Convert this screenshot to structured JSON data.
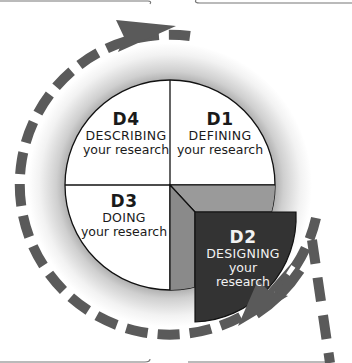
{
  "diagram": {
    "colors": {
      "dash": "#5a5a5a",
      "d2_front": "#333333",
      "d2_top": "#9a9a9a",
      "d2_side": "#8a8a8a",
      "quadrant_fill": "#ffffff",
      "glow": "#b8b8b8"
    },
    "quadrants": [
      {
        "id": "d1",
        "code": "D1",
        "verb": "DEFINING",
        "sub": "your research",
        "position": "top-right"
      },
      {
        "id": "d2",
        "code": "D2",
        "verb": "DESIGNING",
        "sub_line1": "your",
        "sub_line2": "research",
        "position": "bottom-right",
        "highlighted": true
      },
      {
        "id": "d3",
        "code": "D3",
        "verb": "DOING",
        "sub": "your research",
        "position": "bottom-left"
      },
      {
        "id": "d4",
        "code": "D4",
        "verb": "DESCRIBING",
        "sub": "your research",
        "position": "top-left"
      }
    ],
    "arrows": [
      {
        "name": "cycle-arrow",
        "direction": "clockwise",
        "style": "dashed"
      },
      {
        "name": "exit-arrow",
        "direction": "down",
        "style": "dashed"
      }
    ]
  }
}
